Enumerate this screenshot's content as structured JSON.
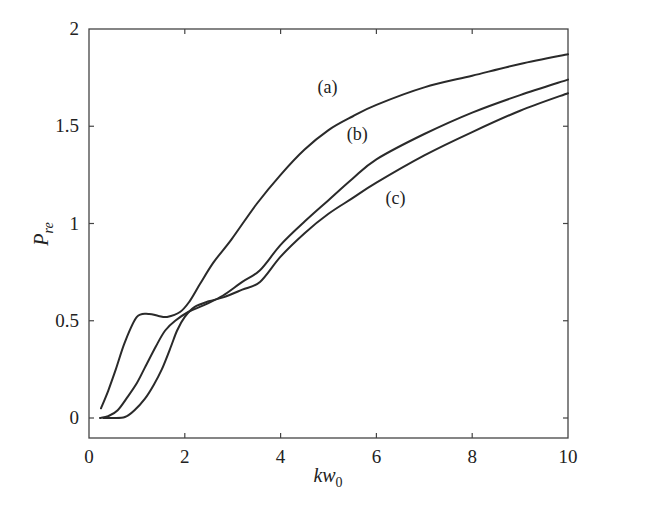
{
  "chart_data": {
    "type": "line",
    "title": "",
    "xlabel": "kw0",
    "xlabel_main": "kw",
    "xlabel_sub": "0",
    "ylabel": "P_re",
    "ylabel_main": "P",
    "ylabel_sub": "re",
    "xlim": [
      0,
      10
    ],
    "ylim": [
      -0.1,
      2
    ],
    "grid": false,
    "legend": "inline labels",
    "xticks": [
      0,
      2,
      4,
      6,
      8,
      10
    ],
    "xtick_labels": [
      "0",
      "2",
      "4",
      "6",
      "8",
      "10"
    ],
    "yticks": [
      0,
      0.5,
      1,
      1.5,
      2
    ],
    "ytick_labels": [
      "0",
      "0.5",
      "1",
      "1.5",
      "2"
    ],
    "series": [
      {
        "name": "(a)",
        "label_pos": [
          4.98,
          1.67
        ],
        "x": [
          0.25,
          0.4,
          0.56,
          0.75,
          1.0,
          1.25,
          1.45,
          1.63,
          1.9,
          2.1,
          2.32,
          2.6,
          2.98,
          3.5,
          4.0,
          4.5,
          5.0,
          5.5,
          6.0,
          7.0,
          8.0,
          9.0,
          10.0
        ],
        "y": [
          0.05,
          0.14,
          0.25,
          0.39,
          0.52,
          0.535,
          0.525,
          0.52,
          0.545,
          0.6,
          0.69,
          0.8,
          0.92,
          1.1,
          1.25,
          1.38,
          1.48,
          1.55,
          1.61,
          1.7,
          1.76,
          1.82,
          1.87
        ]
      },
      {
        "name": "(b)",
        "label_pos": [
          5.6,
          1.43
        ],
        "x": [
          0.23,
          0.4,
          0.6,
          0.81,
          1.0,
          1.17,
          1.4,
          1.59,
          1.8,
          2.07,
          2.4,
          2.8,
          3.2,
          3.57,
          4.0,
          4.5,
          5.0,
          5.5,
          6.0,
          7.0,
          8.0,
          9.0,
          10.0
        ],
        "y": [
          0.0,
          0.01,
          0.04,
          0.11,
          0.18,
          0.26,
          0.37,
          0.45,
          0.5,
          0.545,
          0.58,
          0.63,
          0.7,
          0.76,
          0.89,
          1.01,
          1.12,
          1.23,
          1.33,
          1.46,
          1.57,
          1.66,
          1.74
        ]
      },
      {
        "name": "(c)",
        "label_pos": [
          6.4,
          1.1
        ],
        "x": [
          0.3,
          0.5,
          0.75,
          0.95,
          1.17,
          1.35,
          1.52,
          1.7,
          1.84,
          2.0,
          2.2,
          2.5,
          2.8,
          3.2,
          3.57,
          4.0,
          4.5,
          5.0,
          5.5,
          6.0,
          7.0,
          8.0,
          9.0,
          10.0
        ],
        "y": [
          0.0,
          0.0,
          0.005,
          0.04,
          0.1,
          0.17,
          0.25,
          0.36,
          0.45,
          0.52,
          0.57,
          0.6,
          0.62,
          0.66,
          0.7,
          0.83,
          0.95,
          1.05,
          1.13,
          1.21,
          1.35,
          1.47,
          1.58,
          1.67
        ]
      }
    ]
  }
}
